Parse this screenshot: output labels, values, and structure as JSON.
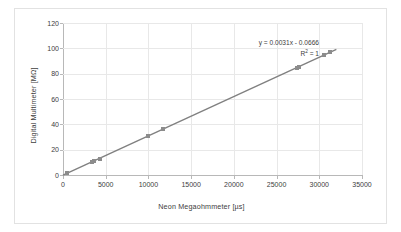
{
  "chart_data": {
    "type": "scatter",
    "title": "",
    "xlabel": "Neon Megaohmmeter [µs]",
    "ylabel": "Digital Multimeter [MΩ]",
    "xlim": [
      0,
      35000
    ],
    "ylim": [
      0,
      120
    ],
    "xticks": [
      0,
      5000,
      10000,
      15000,
      20000,
      25000,
      30000,
      35000
    ],
    "yticks": [
      0,
      20,
      40,
      60,
      80,
      100,
      120
    ],
    "xtick_labels": [
      "0",
      "5000",
      "10000",
      "15000",
      "20000",
      "25000",
      "30000",
      "35000"
    ],
    "ytick_labels": [
      "0",
      "20",
      "40",
      "60",
      "80",
      "100",
      "120"
    ],
    "grid": true,
    "legend": false,
    "marker_color": "#8c8c8c",
    "trendline_color": "#808080",
    "gridline_color": "#e8e8e8",
    "axis_color": "#b8b8b8",
    "text_color": "#404040",
    "series": [
      {
        "name": "Measurements",
        "points": [
          {
            "x": 450,
            "y": 1.3
          },
          {
            "x": 3400,
            "y": 10.5
          },
          {
            "x": 3600,
            "y": 11.1
          },
          {
            "x": 4300,
            "y": 12.9
          },
          {
            "x": 9950,
            "y": 30.7
          },
          {
            "x": 11650,
            "y": 36.0
          },
          {
            "x": 27350,
            "y": 84.7
          },
          {
            "x": 27600,
            "y": 85.2
          },
          {
            "x": 30600,
            "y": 95.0
          },
          {
            "x": 31250,
            "y": 97.2
          }
        ]
      }
    ],
    "trendline": {
      "type": "linear",
      "slope": 0.0031,
      "intercept": -0.0666,
      "r_squared": 1,
      "equation_label": "y = 0.0031x - 0.0666",
      "r2_label_prefix": "R",
      "r2_label_sup": "2",
      "r2_label_suffix": " = 1",
      "x_start": 0,
      "x_end": 32000
    }
  }
}
